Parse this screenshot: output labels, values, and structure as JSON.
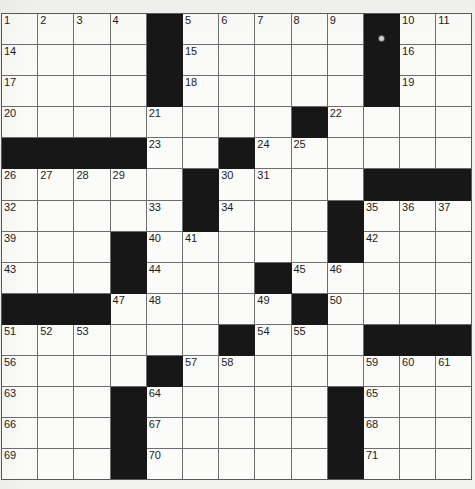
{
  "page": {
    "clipped_header_left": "...",
    "clipped_header_right": "..."
  },
  "puzzle": {
    "columns": 13,
    "rows": 15,
    "cell_colors": {
      "empty_cell": "#fbfbfa",
      "block_cell": "#171717",
      "grid_line": "#6e6e6e",
      "number_text": "#1b1b1b",
      "paper": "#f2f2f0"
    },
    "grid": [
      [
        {
          "n": "1"
        },
        {
          "n": "2"
        },
        {
          "n": "3"
        },
        {
          "n": "4"
        },
        {
          "b": true
        },
        {
          "n": "5"
        },
        {
          "n": "6"
        },
        {
          "n": "7"
        },
        {
          "n": "8"
        },
        {
          "n": "9"
        },
        {
          "b": true,
          "speck": true
        },
        {
          "n": "10"
        },
        {
          "n": "11"
        }
      ],
      [
        {
          "n": "14"
        },
        {},
        {},
        {},
        {
          "b": true
        },
        {
          "n": "15"
        },
        {},
        {},
        {},
        {},
        {
          "b": true
        },
        {
          "n": "16"
        },
        {}
      ],
      [
        {
          "n": "17"
        },
        {},
        {},
        {},
        {
          "b": true
        },
        {
          "n": "18"
        },
        {},
        {},
        {},
        {},
        {
          "b": true
        },
        {
          "n": "19"
        },
        {}
      ],
      [
        {
          "n": "20"
        },
        {},
        {},
        {},
        {
          "n": "21"
        },
        {},
        {},
        {},
        {
          "b": true
        },
        {
          "n": "22"
        },
        {},
        {},
        {}
      ],
      [
        {
          "b": true
        },
        {
          "b": true
        },
        {
          "b": true
        },
        {
          "b": true
        },
        {
          "n": "23"
        },
        {},
        {
          "b": true
        },
        {
          "n": "24"
        },
        {
          "n": "25"
        },
        {},
        {},
        {},
        {}
      ],
      [
        {
          "n": "26"
        },
        {
          "n": "27"
        },
        {
          "n": "28"
        },
        {
          "n": "29"
        },
        {},
        {
          "b": true
        },
        {
          "n": "30"
        },
        {
          "n": "31"
        },
        {},
        {},
        {
          "b": true
        },
        {
          "b": true
        },
        {
          "b": true
        }
      ],
      [
        {
          "n": "32"
        },
        {},
        {},
        {},
        {
          "n": "33"
        },
        {
          "b": true
        },
        {
          "n": "34"
        },
        {},
        {},
        {
          "b": true
        },
        {
          "n": "35"
        },
        {
          "n": "36"
        },
        {
          "n": "37"
        }
      ],
      [
        {
          "n": "39"
        },
        {},
        {},
        {
          "b": true
        },
        {
          "n": "40"
        },
        {
          "n": "41"
        },
        {},
        {},
        {},
        {
          "b": true
        },
        {
          "n": "42"
        },
        {},
        {}
      ],
      [
        {
          "n": "43"
        },
        {},
        {},
        {
          "b": true
        },
        {
          "n": "44"
        },
        {},
        {},
        {
          "b": true
        },
        {
          "n": "45"
        },
        {
          "n": "46"
        },
        {},
        {},
        {}
      ],
      [
        {
          "b": true
        },
        {
          "b": true
        },
        {
          "b": true
        },
        {
          "n": "47"
        },
        {
          "n": "48"
        },
        {},
        {},
        {
          "n": "49"
        },
        {
          "b": true
        },
        {
          "n": "50"
        },
        {},
        {},
        {}
      ],
      [
        {
          "n": "51"
        },
        {
          "n": "52"
        },
        {
          "n": "53"
        },
        {},
        {},
        {},
        {
          "b": true
        },
        {
          "n": "54"
        },
        {
          "n": "55"
        },
        {},
        {
          "b": true
        },
        {
          "b": true
        },
        {
          "b": true
        }
      ],
      [
        {
          "n": "56"
        },
        {},
        {},
        {},
        {
          "b": true
        },
        {
          "n": "57"
        },
        {
          "n": "58"
        },
        {},
        {},
        {},
        {
          "n": "59"
        },
        {
          "n": "60"
        },
        {
          "n": "61"
        }
      ],
      [
        {
          "n": "63"
        },
        {},
        {},
        {
          "b": true
        },
        {
          "n": "64"
        },
        {},
        {},
        {},
        {},
        {
          "b": true
        },
        {
          "n": "65"
        },
        {},
        {}
      ],
      [
        {
          "n": "66"
        },
        {},
        {},
        {
          "b": true
        },
        {
          "n": "67"
        },
        {},
        {},
        {},
        {},
        {
          "b": true
        },
        {
          "n": "68"
        },
        {},
        {}
      ],
      [
        {
          "n": "69"
        },
        {},
        {},
        {
          "b": true
        },
        {
          "n": "70"
        },
        {},
        {},
        {},
        {},
        {
          "b": true
        },
        {
          "n": "71"
        },
        {},
        {}
      ]
    ],
    "extra_right_numbers": {
      "row1_col13": "12",
      "row1_col14": "13"
    }
  }
}
